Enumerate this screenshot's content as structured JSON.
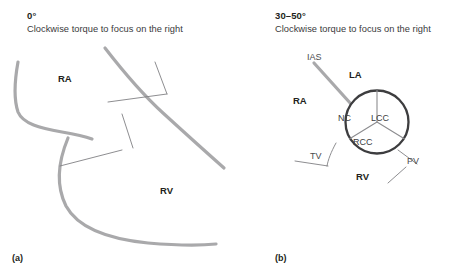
{
  "figure": {
    "panels": [
      {
        "id": "a",
        "caption": "(a)",
        "header": {
          "angle": "0°",
          "subtitle": "Clockwise torque to focus on the right"
        },
        "labels": [
          {
            "name": "chamber-label-ra",
            "text": "RA",
            "style": "bold",
            "x": 58,
            "y": 74
          },
          {
            "name": "chamber-label-rv",
            "text": "RV",
            "style": "bold",
            "x": 160,
            "y": 186
          }
        ]
      },
      {
        "id": "b",
        "caption": "(b)",
        "header": {
          "angle": "30–50°",
          "subtitle": "Clockwise torque to focus on the right"
        },
        "labels": [
          {
            "name": "structure-label-ias",
            "text": "IAS",
            "style": "thin",
            "x": 42,
            "y": 53
          },
          {
            "name": "chamber-label-la",
            "text": "LA",
            "style": "bold",
            "x": 84,
            "y": 70
          },
          {
            "name": "chamber-label-ra",
            "text": "RA",
            "style": "bold",
            "x": 28,
            "y": 96
          },
          {
            "name": "chamber-label-rv",
            "text": "RV",
            "style": "bold",
            "x": 91,
            "y": 172
          },
          {
            "name": "valve-label-tv",
            "text": "TV",
            "style": "thin",
            "x": 45,
            "y": 152
          },
          {
            "name": "valve-label-pv",
            "text": "PV",
            "style": "thin",
            "x": 142,
            "y": 157
          }
        ],
        "aortic_valve": {
          "name": "aortic-valve-short-axis",
          "cusps": [
            {
              "name": "cusp-label-nc",
              "text": "NC",
              "x": 73,
              "y": 114
            },
            {
              "name": "cusp-label-lcc",
              "text": "LCC",
              "x": 106,
              "y": 114
            },
            {
              "name": "cusp-label-rcc",
              "text": "RCC",
              "x": 88,
              "y": 138
            }
          ]
        }
      }
    ],
    "colors": {
      "stroke_thick": "#a9a9ab",
      "stroke_thin": "#808083",
      "valve_ring": "#3d3d3f",
      "cusp_divider": "#8c8c8f",
      "text": "#231f20",
      "text_muted": "#4b4b4d",
      "background": "#ffffff"
    }
  }
}
